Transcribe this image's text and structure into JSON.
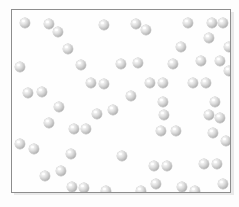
{
  "figure": {
    "particle_label": "gas-particle",
    "particle_count": 63,
    "colors": {
      "background": "#ffffff",
      "frame_border": "#8d8d8d",
      "frame_shadow": "#d8d8d8",
      "particle_light": "#ffffff",
      "particle_mid": "#dcdcdc",
      "particle_dark": "#8e8e8e"
    },
    "frame": {
      "x": 11,
      "y": 9,
      "width": 220,
      "height": 184
    },
    "particle_radius": 5
  },
  "chart_data": {
    "type": "scatter",
    "xlabel": "",
    "ylabel": "",
    "xlim": [
      11,
      231
    ],
    "ylim": [
      9,
      193
    ],
    "grid": false,
    "legend": "none",
    "marker": "sphere",
    "marker_size": 10,
    "points": [
      [
        24,
        22
      ],
      [
        48,
        23
      ],
      [
        57,
        31
      ],
      [
        103,
        24
      ],
      [
        135,
        23
      ],
      [
        145,
        29
      ],
      [
        187,
        22
      ],
      [
        211,
        22
      ],
      [
        222,
        22
      ],
      [
        208,
        37
      ],
      [
        19,
        66
      ],
      [
        80,
        64
      ],
      [
        120,
        63
      ],
      [
        172,
        63
      ],
      [
        219,
        60
      ],
      [
        228,
        70
      ],
      [
        27,
        92
      ],
      [
        41,
        91
      ],
      [
        90,
        82
      ],
      [
        103,
        83
      ],
      [
        149,
        82
      ],
      [
        162,
        82
      ],
      [
        192,
        82
      ],
      [
        205,
        82
      ],
      [
        162,
        101
      ],
      [
        214,
        101
      ],
      [
        112,
        109
      ],
      [
        163,
        114
      ],
      [
        208,
        114
      ],
      [
        219,
        117
      ],
      [
        48,
        122
      ],
      [
        73,
        128
      ],
      [
        85,
        128
      ],
      [
        160,
        130
      ],
      [
        212,
        132
      ],
      [
        19,
        143
      ],
      [
        33,
        148
      ],
      [
        70,
        153
      ],
      [
        121,
        155
      ],
      [
        153,
        165
      ],
      [
        166,
        165
      ],
      [
        203,
        163
      ],
      [
        216,
        163
      ],
      [
        44,
        175
      ],
      [
        71,
        186
      ],
      [
        83,
        187
      ],
      [
        155,
        183
      ],
      [
        181,
        186
      ],
      [
        194,
        190
      ],
      [
        222,
        183
      ],
      [
        228,
        46
      ],
      [
        137,
        62
      ],
      [
        58,
        106
      ],
      [
        96,
        113
      ],
      [
        180,
        46
      ],
      [
        225,
        140
      ],
      [
        60,
        170
      ],
      [
        105,
        190
      ],
      [
        140,
        190
      ],
      [
        200,
        60
      ],
      [
        175,
        130
      ],
      [
        130,
        95
      ],
      [
        67,
        48
      ]
    ]
  }
}
